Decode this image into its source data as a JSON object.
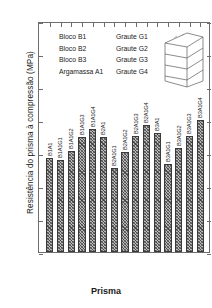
{
  "chart_data": {
    "type": "bar",
    "title": "",
    "subtitle": "",
    "xlabel": "Prisma",
    "ylabel": "Resistência do prisma à compressão (MPa)",
    "ylim": [
      0,
      35
    ],
    "yticks": [
      0,
      5,
      10,
      15,
      20,
      25,
      30,
      35
    ],
    "grid": false,
    "legend_position": "top-left",
    "categories": [
      "B1A1",
      "B1A1G1",
      "B1A1G2",
      "B1A1G3",
      "B1A1G4",
      "B2A1",
      "B2A1G1",
      "B2A1G2",
      "B2A1G3",
      "B2A1G4",
      "B3A1",
      "B3A1G1",
      "B3A1G2",
      "B3A1G3",
      "B3A1G4"
    ],
    "values": [
      14.3,
      14.0,
      15.3,
      17.5,
      18.6,
      17.4,
      12.8,
      15.2,
      17.6,
      19.2,
      18.0,
      13.3,
      15.7,
      17.6,
      20.0
    ],
    "bar_fill": "#b9b9b9",
    "bar_edge": "#3a3a3a",
    "axis_color": "#6e6e6e"
  },
  "legend": {
    "rows": [
      {
        "left": "Bloco B1",
        "right": "Graute G1"
      },
      {
        "left": "Bloco B2",
        "right": "Graute G2"
      },
      {
        "left": "Bloco B3",
        "right": "Graute G3"
      },
      {
        "left": "Argamassa A1",
        "right": "Graute G4"
      }
    ]
  },
  "diagram": {
    "name": "prism-illustration"
  }
}
